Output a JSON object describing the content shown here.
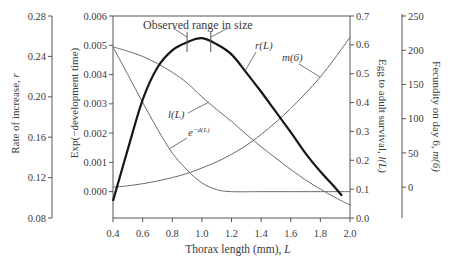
{
  "chart_data": {
    "type": "line",
    "title": "",
    "xlabel": "Thorax length (mm), L",
    "xlabel_text": "Thorax length (mm), ",
    "xlabel_var": "L",
    "xlim": [
      0.4,
      2.0
    ],
    "xticks": [
      0.4,
      0.6,
      0.8,
      1.0,
      1.2,
      1.4,
      1.6,
      1.8,
      2.0
    ],
    "xtick_labels": [
      "0.4",
      "0.6",
      "0.8",
      "1.0",
      "1.2",
      "1.4",
      "1.6",
      "1.8",
      "2.0"
    ],
    "grid": false,
    "legend": "none (curves labeled directly)",
    "axes": [
      {
        "id": "r",
        "side": "left-outer",
        "label": "Rate of increase, r",
        "label_text": "Rate of increase, ",
        "label_var": "r",
        "ylim": [
          0.08,
          0.28
        ],
        "ticks": [
          0.08,
          0.12,
          0.16,
          0.2,
          0.24,
          0.28
        ],
        "tick_labels": [
          "0.08",
          "0.12",
          "0.16",
          "0.20",
          "0.24",
          "0.28"
        ]
      },
      {
        "id": "exp",
        "side": "left",
        "label": "Exp(−development time)",
        "label_text": "Exp(−development time)",
        "label_var": "",
        "ylim": [
          -0.0009,
          0.006
        ],
        "ticks": [
          0.0,
          0.001,
          0.002,
          0.003,
          0.004,
          0.005,
          0.006
        ],
        "tick_labels": [
          "0.000",
          "0.001",
          "0.002",
          "0.003",
          "0.004",
          "0.005",
          "0.006"
        ]
      },
      {
        "id": "surv",
        "side": "right",
        "label": "Egg to adult survival, l(L)",
        "label_text": "Egg to adult survival, ",
        "label_var": "l(L)",
        "ylim": [
          0.0,
          0.7
        ],
        "ticks": [
          0.0,
          0.1,
          0.2,
          0.3,
          0.4,
          0.5,
          0.6,
          0.7
        ],
        "tick_labels": [
          "0.0",
          "0.1",
          "0.2",
          "0.3",
          "0.4",
          "0.5",
          "0.6",
          "0.7"
        ]
      },
      {
        "id": "fec",
        "side": "right-outer",
        "label": "Fecundity on day 6, m(6)",
        "label_text": "Fecundity on day 6, ",
        "label_var": "m(6)",
        "ylim": [
          -45,
          250
        ],
        "ticks": [
          0,
          50,
          100,
          150,
          200,
          250
        ],
        "tick_labels": [
          "0",
          "50",
          "100",
          "150",
          "200",
          "250"
        ]
      }
    ],
    "series": [
      {
        "name": "r(L)",
        "axis": "r",
        "style": "thick",
        "x": [
          0.4,
          0.5,
          0.6,
          0.7,
          0.8,
          0.9,
          1.0,
          1.1,
          1.2,
          1.3,
          1.4,
          1.5,
          1.6,
          1.7,
          1.8,
          1.9,
          1.946
        ],
        "values": [
          0.097,
          0.148,
          0.197,
          0.229,
          0.246,
          0.254,
          0.258,
          0.252,
          0.242,
          0.224,
          0.205,
          0.185,
          0.165,
          0.144,
          0.126,
          0.11,
          0.102
        ]
      },
      {
        "name": "e^{-d(L)}",
        "label_base": "e",
        "label_sup": "−d(L)",
        "axis": "exp",
        "style": "thin",
        "x": [
          0.4,
          0.5,
          0.6,
          0.7,
          0.8,
          0.9,
          1.0,
          1.1,
          1.2,
          1.4,
          1.6,
          1.8,
          2.0
        ],
        "values": [
          0.00494,
          0.004,
          0.00305,
          0.00214,
          0.00132,
          0.00074,
          0.0003,
          7e-05,
          0.0,
          0.0,
          0.0,
          0.0,
          0.0
        ]
      },
      {
        "name": "l(L)",
        "axis": "surv",
        "style": "thin",
        "x": [
          0.4,
          0.5,
          0.6,
          0.7,
          0.8,
          0.9,
          1.0,
          1.1,
          1.2,
          1.3,
          1.4,
          1.5,
          1.6,
          1.7,
          1.8,
          1.9,
          2.0
        ],
        "values": [
          0.593,
          0.578,
          0.56,
          0.535,
          0.505,
          0.468,
          0.42,
          0.376,
          0.335,
          0.29,
          0.247,
          0.207,
          0.168,
          0.132,
          0.1,
          0.071,
          0.045
        ]
      },
      {
        "name": "m(6)",
        "axis": "fec",
        "style": "thin",
        "x": [
          0.4,
          0.5,
          0.6,
          0.7,
          0.8,
          0.9,
          1.0,
          1.1,
          1.2,
          1.3,
          1.4,
          1.5,
          1.6,
          1.7,
          1.8,
          1.9,
          2.0
        ],
        "values": [
          0,
          2,
          5,
          9,
          14,
          20,
          28,
          37,
          48,
          61,
          77,
          95,
          115,
          137,
          161,
          189,
          219
        ]
      }
    ],
    "annotations": {
      "observed_range": {
        "text": "Observed range in size",
        "x_range": [
          0.9,
          1.06
        ]
      }
    }
  }
}
